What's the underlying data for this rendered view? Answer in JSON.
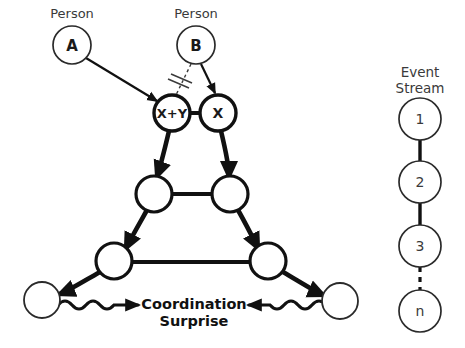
{
  "diagram": {
    "title_text": "Coordination Surprise",
    "colors": {
      "stroke_heavy": "#111111",
      "stroke_light": "#3a3a3a",
      "background": "#ffffff",
      "text": "#1a1a1a"
    },
    "persons": [
      {
        "caption": "Person",
        "label": "A",
        "cx": 72,
        "cy": 45,
        "r": 19
      },
      {
        "caption": "Person",
        "label": "B",
        "cx": 196,
        "cy": 45,
        "r": 19
      }
    ],
    "event_nodes": [
      {
        "label": "X+Y",
        "cx": 172,
        "cy": 113,
        "r": 18,
        "bold": true
      },
      {
        "label": "X",
        "cx": 218,
        "cy": 113,
        "r": 18,
        "bold": true
      },
      {
        "label": "",
        "cx": 154,
        "cy": 194,
        "r": 18,
        "bold": false
      },
      {
        "label": "",
        "cx": 230,
        "cy": 194,
        "r": 18,
        "bold": false
      },
      {
        "label": "",
        "cx": 114,
        "cy": 261,
        "r": 18,
        "bold": false
      },
      {
        "label": "",
        "cx": 268,
        "cy": 261,
        "r": 18,
        "bold": false
      },
      {
        "label": "",
        "cx": 42,
        "cy": 300,
        "r": 18,
        "bold": false
      },
      {
        "label": "",
        "cx": 340,
        "cy": 301,
        "r": 18,
        "bold": false
      }
    ],
    "relations": {
      "person_a_to_xy": "directed-arrow",
      "person_b_to_x": "directed-arrow",
      "person_b_to_xy": "blocked-dashed",
      "block_marker": "double-slash"
    },
    "surprise_connector": "wavy-double-arrow"
  },
  "event_stream": {
    "caption_line1": "Event",
    "caption_line2": "Stream",
    "nodes": [
      {
        "label": "1",
        "cx": 420,
        "cy": 119,
        "r": 21
      },
      {
        "label": "2",
        "cx": 420,
        "cy": 182,
        "r": 21
      },
      {
        "label": "3",
        "cx": 420,
        "cy": 246,
        "r": 21
      },
      {
        "label": "n",
        "cx": 420,
        "cy": 311,
        "r": 21
      }
    ],
    "links": [
      {
        "from": "1",
        "to": "2",
        "style": "solid"
      },
      {
        "from": "2",
        "to": "3",
        "style": "solid"
      },
      {
        "from": "3",
        "to": "n",
        "style": "dashed"
      }
    ]
  }
}
